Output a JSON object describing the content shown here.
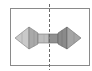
{
  "diagram": {
    "type": "symmetric-shape-with-axis",
    "frame": {
      "x": 10,
      "y": 8,
      "width": 79,
      "height": 57,
      "stroke": "#8a8a8a"
    },
    "axis": {
      "x": 49,
      "y1": 4,
      "y2": 70,
      "style": "dashed",
      "stroke": "#6a6a6a"
    },
    "colors": {
      "left_light": "#c9c9c9",
      "left_mid": "#b0b0b0",
      "left_dark": "#9c9c9c",
      "bar_left": "#bdbdbd",
      "bar_right": "#8f8f8f",
      "right_light": "#a5a5a5",
      "right_mid": "#8a8a8a",
      "right_dark": "#7a7a7a",
      "edge": "#6f6f6f"
    }
  }
}
